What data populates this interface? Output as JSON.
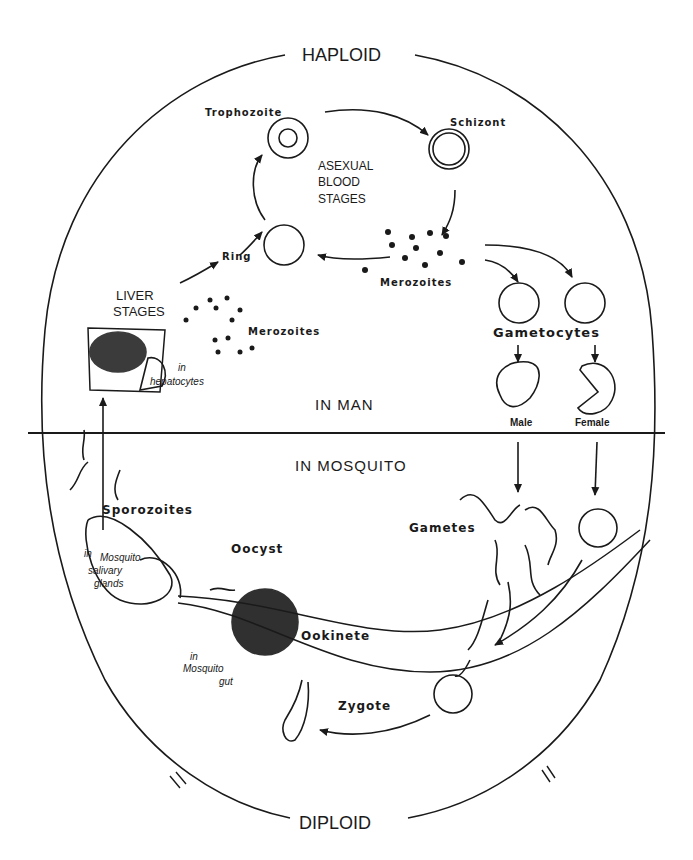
{
  "diagram": {
    "ploidy": {
      "top": "HAPLOID",
      "bottom": "DIPLOID"
    },
    "hosts": {
      "upper": "IN MAN",
      "lower": "IN MOSQUITO"
    },
    "blood_cycle": {
      "heading_lines": [
        "ASEXUAL",
        "BLOOD",
        "STAGES"
      ],
      "stages": [
        "Trophozoite",
        "Schizont",
        "Merozoites",
        "Ring"
      ]
    },
    "liver": {
      "heading_lines": [
        "LIVER",
        "STAGES"
      ],
      "merozoites": "Merozoites",
      "location_lines": [
        "in",
        "hepatocytes"
      ]
    },
    "gametocytes": {
      "label": "Gametocytes",
      "male": "Male",
      "female": "Female"
    },
    "mosquito": {
      "sporozoites": "Sporozoites",
      "salivary_lines": [
        "in",
        "Mosquito",
        "salivary",
        "glands"
      ],
      "oocyst": "Oocyst",
      "ookinete": "Ookinete",
      "gut_lines": [
        "in",
        "Mosquito",
        "gut"
      ],
      "zygote": "Zygote",
      "gametes": "Gametes"
    },
    "colors": {
      "ink": "#1a1a1a",
      "background": "#ffffff"
    }
  }
}
